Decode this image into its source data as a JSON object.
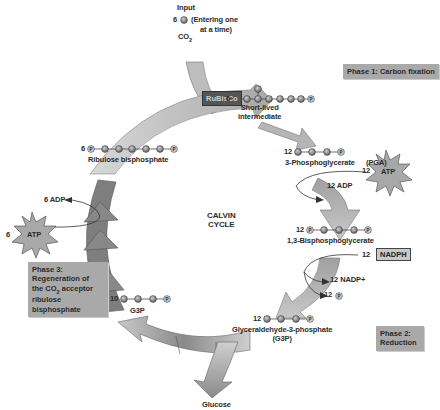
{
  "input": {
    "label": "Input",
    "count": "6",
    "note_line1": "(Entering one",
    "note_line2": "at a time)",
    "molecule": "CO",
    "molecule_sub": "2"
  },
  "enzyme": {
    "label": "RuBisCo"
  },
  "phases": {
    "phase1": {
      "line1": "Phase 1: Carbon fixation"
    },
    "phase2": {
      "line1": "Phase 2:",
      "line2": "Reduction"
    },
    "phase3": {
      "line1": "Phase 3:",
      "line2": "Regeneration of",
      "line3_pre": "the CO",
      "line3_sub": "2",
      "line3_post": " acceptor",
      "line4": "ribulose bisphosphate"
    }
  },
  "center": {
    "line1": "CALVIN",
    "line2": "CYCLE"
  },
  "molecules": {
    "intermediate": {
      "count": "6",
      "label_line1": "Short-lived",
      "label_line2": "intermediate"
    },
    "pga": {
      "count": "12",
      "label": "3-Phosphoglycerate",
      "abbrev": "(PGA)"
    },
    "bpg": {
      "count": "12",
      "label": "1,3-Bisphosphoglycerate"
    },
    "g3p": {
      "count": "12",
      "label_line1": "Glyceraldehyde-3-phosphate",
      "label_line2": "(G3P)"
    },
    "g3p_recycled": {
      "count": "10",
      "label": "G3P"
    },
    "rubp": {
      "count": "6",
      "label": "Ribulose bisphosphate"
    }
  },
  "energy": {
    "atp_reduction": {
      "count": "12",
      "label": "ATP",
      "product": "12 ADP"
    },
    "nadph": {
      "count": "12",
      "label": "NADPH",
      "product1": "12 NADP+",
      "product2_count": "12",
      "product2_symbol": "P"
    },
    "atp_regeneration": {
      "count": "6",
      "label": "ATP",
      "product": "6 ADP"
    }
  },
  "output": {
    "label": "Glucose"
  },
  "colors": {
    "arrow_dark": "#7a7a7a",
    "arrow_light": "#b8b8b8",
    "phase_box": "#a9a9a9",
    "molecule_ball": "#8a8a8a"
  }
}
